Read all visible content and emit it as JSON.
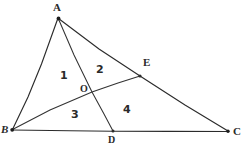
{
  "figure": {
    "kind": "geometry-diagram",
    "stroke_color": "#2b2b2b",
    "background_color": "#ffffff",
    "vertex_labels": [
      {
        "id": "A",
        "text": "A",
        "x": 58,
        "y": 18
      },
      {
        "id": "B",
        "text": "B",
        "x": 12,
        "y": 130
      },
      {
        "id": "C",
        "text": "C",
        "x": 228,
        "y": 131
      }
    ],
    "point_labels": [
      {
        "id": "D",
        "text": "D",
        "x": 113,
        "y": 131
      },
      {
        "id": "E",
        "text": "E",
        "x": 140,
        "y": 76
      },
      {
        "id": "O",
        "text": "O",
        "x": 92,
        "y": 92
      }
    ],
    "region_labels": [
      {
        "id": "1",
        "text": "1",
        "x": 63,
        "y": 76
      },
      {
        "id": "2",
        "text": "2",
        "x": 100,
        "y": 71
      },
      {
        "id": "3",
        "text": "3",
        "x": 76,
        "y": 116
      },
      {
        "id": "4",
        "text": "4",
        "x": 128,
        "y": 112
      }
    ],
    "segments": [
      {
        "name": "side-AB",
        "from": "A",
        "to": "B"
      },
      {
        "name": "side-BC",
        "from": "B",
        "to": "C"
      },
      {
        "name": "side-AC",
        "from": "A",
        "to": "C"
      },
      {
        "name": "cevian-AD",
        "from": "A",
        "to": "D"
      },
      {
        "name": "cevian-BE",
        "from": "B",
        "to": "E"
      }
    ]
  }
}
